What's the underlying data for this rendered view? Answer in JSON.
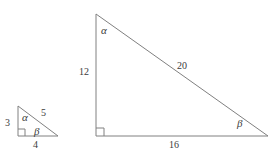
{
  "figure": {
    "stroke_color": "#808080",
    "text_color": "#3b3b3b",
    "background_color": "#ffffff"
  },
  "small_triangle": {
    "name": "small-right-triangle",
    "vertices": {
      "top": [
        18,
        106
      ],
      "right_angle": [
        18,
        136
      ],
      "bottom_right": [
        58,
        136
      ]
    },
    "labels": {
      "vertical_leg": "3",
      "horizontal_leg": "4",
      "hypotenuse": "5",
      "angle_top": "α",
      "angle_bottom_right": "β"
    }
  },
  "large_triangle": {
    "name": "large-right-triangle",
    "vertices": {
      "top": [
        96,
        14
      ],
      "right_angle": [
        96,
        136
      ],
      "bottom_right": [
        268,
        136
      ]
    },
    "labels": {
      "vertical_leg": "12",
      "horizontal_leg": "16",
      "hypotenuse": "20",
      "angle_top": "α",
      "angle_bottom_right": "β"
    }
  }
}
